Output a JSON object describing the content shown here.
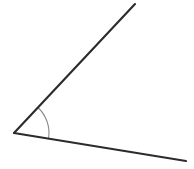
{
  "figure": {
    "name": "angle-diagram",
    "width": 194,
    "height": 169,
    "background_color": "#ffffff"
  },
  "geometry": {
    "vertex": {
      "x": 14,
      "y": 133
    },
    "rays": [
      {
        "name": "upper-ray",
        "from": {
          "x": 14,
          "y": 133
        },
        "to": {
          "x": 135,
          "y": 4
        },
        "direction_degrees": 46.8,
        "length_px": 176.8,
        "color": "#2b2b2f",
        "width_px": 2.1
      },
      {
        "name": "lower-ray",
        "from": {
          "x": 14,
          "y": 133
        },
        "to": {
          "x": 186,
          "y": 161
        },
        "direction_degrees": -9.2,
        "length_px": 174.3,
        "color": "#2b2b2f",
        "width_px": 2.1
      }
    ],
    "angle_arc": {
      "name": "angle-arc",
      "center": {
        "x": 14,
        "y": 133
      },
      "radius_px": 35,
      "start_point": {
        "x": 38,
        "y": 107
      },
      "end_point": {
        "x": 48.5,
        "y": 138.6
      },
      "start_angle_degrees": 46.8,
      "end_angle_degrees": -9.2,
      "sweep_degrees": 56,
      "color": "#8b8b8f",
      "width_px": 1.1
    },
    "measured_angle_degrees": 56
  },
  "colors": {
    "stroke_dark": "#2b2b2f",
    "stroke_arc": "#8b8b8f",
    "background": "#ffffff"
  }
}
